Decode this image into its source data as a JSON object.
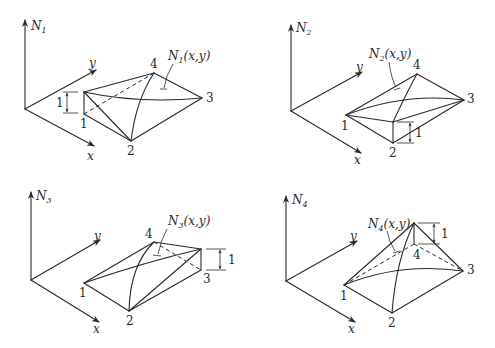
{
  "figure": {
    "axis_labels": {
      "x": "x",
      "y": "y"
    },
    "panels": [
      {
        "id": "N1",
        "axis_title": "N",
        "axis_sub": "1",
        "function_label": "N",
        "function_sub": "1",
        "function_args": "(x,y)",
        "nodes": [
          "1",
          "2",
          "3",
          "4"
        ],
        "unit_height_label": "1",
        "raised_node": "1"
      },
      {
        "id": "N2",
        "axis_title": "N",
        "axis_sub": "2",
        "function_label": "N",
        "function_sub": "2",
        "function_args": "(x,y)",
        "nodes": [
          "1",
          "2",
          "3",
          "4"
        ],
        "unit_height_label": "1",
        "raised_node": "2"
      },
      {
        "id": "N3",
        "axis_title": "N",
        "axis_sub": "3",
        "function_label": "N",
        "function_sub": "3",
        "function_args": "(x,y)",
        "nodes": [
          "1",
          "2",
          "3",
          "4"
        ],
        "unit_height_label": "1",
        "raised_node": "3"
      },
      {
        "id": "N4",
        "axis_title": "N",
        "axis_sub": "4",
        "function_label": "N",
        "function_sub": "4",
        "function_args": "(x,y)",
        "nodes": [
          "1",
          "2",
          "3",
          "4"
        ],
        "unit_height_label": "1",
        "raised_node": "4"
      }
    ]
  }
}
